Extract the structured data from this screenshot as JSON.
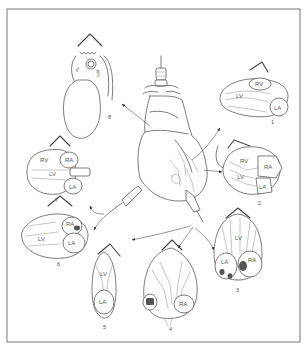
{
  "figure": {
    "type": "anatomical diagram",
    "border_color": "#8c8c8c",
    "line_color": "#5a5a5a",
    "center": {
      "label": "heart with transducer positions",
      "probes": [
        "suprasternal transducer",
        "parasternal transducer",
        "apical transducer"
      ]
    },
    "views": [
      {
        "number": "1",
        "chambers": [
          "RV",
          "LV",
          "LA"
        ]
      },
      {
        "number": "2",
        "chambers": [
          "RV",
          "LV",
          "RA",
          "LA"
        ]
      },
      {
        "number": "3",
        "chambers": [
          "LV",
          "LA",
          "RA"
        ]
      },
      {
        "number": "4",
        "chambers": [
          "RA"
        ]
      },
      {
        "number": "5",
        "chambers": [
          "LV",
          "LA"
        ]
      },
      {
        "number": "6",
        "chambers": [
          "LV",
          "RA",
          "LA"
        ]
      },
      {
        "number": "7",
        "chambers": [
          "RV",
          "RA",
          "LV",
          "LA"
        ]
      },
      {
        "number": "8",
        "chambers": [
          "Ao",
          "RPA"
        ]
      }
    ]
  }
}
